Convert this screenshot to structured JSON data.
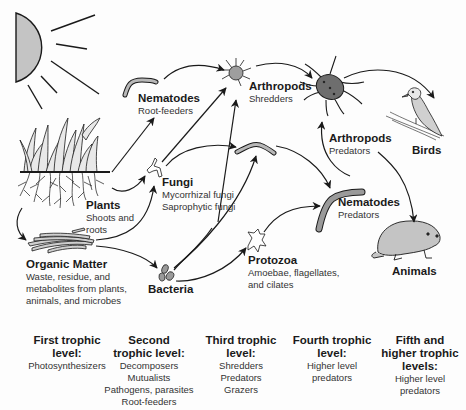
{
  "diagram": {
    "colors": {
      "line": "#1a1a1a",
      "fill_gray": "#bdbdbd",
      "fill_dark": "#6e6e6e",
      "background": "#fdfdfd"
    },
    "nodes": {
      "sun": {
        "icon": "sun-icon"
      },
      "plants": {
        "title": "Plants",
        "sub": [
          "Shoots and",
          "roots"
        ],
        "icon": "grass-plants-icon"
      },
      "organic_matter": {
        "title": "Organic Matter",
        "sub": [
          "Waste, residue, and",
          "metabolites from plants,",
          "animals, and microbes"
        ],
        "icon": "organic-matter-icon"
      },
      "nematodes_root": {
        "title": "Nematodes",
        "sub": [
          "Root-feeders"
        ],
        "icon": "nematode-icon"
      },
      "fungi": {
        "title": "Fungi",
        "sub": [
          "Mycorrhizal fungi",
          "Saprophytic fungi"
        ],
        "icon": "fungi-hyphae-icon"
      },
      "bacteria": {
        "title": "Bacteria",
        "icon": "bacteria-icon"
      },
      "arthropods_shred": {
        "title": "Arthropods",
        "sub": [
          "Shredders"
        ],
        "icon": "mite-icon"
      },
      "nematode_mid": {
        "icon": "nematode-icon"
      },
      "protozoa": {
        "title": "Protozoa",
        "sub": [
          "Amoebae, flagellates,",
          "and cilates"
        ],
        "icon": "protozoa-icon"
      },
      "arthropods_pred": {
        "title": "Arthropods",
        "sub": [
          "Predators"
        ],
        "icon": "predator-mite-icon"
      },
      "nematodes_pred": {
        "title": "Nematodes",
        "sub": [
          "Predators"
        ],
        "icon": "nematode-icon"
      },
      "birds": {
        "title": "Birds",
        "icon": "bird-icon"
      },
      "animals": {
        "title": "Animals",
        "icon": "mole-animal-icon"
      }
    },
    "edges": [
      [
        "plants",
        "nematodes_root"
      ],
      [
        "plants",
        "fungi"
      ],
      [
        "plants",
        "organic_matter"
      ],
      [
        "organic_matter",
        "fungi"
      ],
      [
        "organic_matter",
        "bacteria"
      ],
      [
        "nematodes_root",
        "arthropods_shred"
      ],
      [
        "fungi",
        "arthropods_shred"
      ],
      [
        "fungi",
        "nematode_mid"
      ],
      [
        "bacteria",
        "arthropods_shred"
      ],
      [
        "bacteria",
        "nematode_mid"
      ],
      [
        "bacteria",
        "protozoa"
      ],
      [
        "arthropods_shred",
        "arthropods_pred"
      ],
      [
        "nematode_mid",
        "nematodes_pred"
      ],
      [
        "protozoa",
        "nematodes_pred"
      ],
      [
        "nematodes_pred",
        "arthropods_pred"
      ],
      [
        "arthropods_pred",
        "birds"
      ],
      [
        "arthropods_pred",
        "animals"
      ]
    ]
  },
  "trophic_levels": [
    {
      "heading": [
        "First trophic",
        "level:"
      ],
      "items": [
        "Photosynthesizers"
      ]
    },
    {
      "heading": [
        "Second",
        "trophic level:"
      ],
      "items": [
        "Decomposers",
        "Mutualists",
        "Pathogens, parasites",
        "Root-feeders"
      ]
    },
    {
      "heading": [
        "Third trophic",
        "level:"
      ],
      "items": [
        "Shredders",
        "Predators",
        "Grazers"
      ]
    },
    {
      "heading": [
        "Fourth trophic",
        "level:"
      ],
      "items": [
        "Higher level",
        "predators"
      ]
    },
    {
      "heading": [
        "Fifth and",
        "higher trophic",
        "levels:"
      ],
      "items": [
        "Higher level",
        "predators"
      ]
    }
  ]
}
